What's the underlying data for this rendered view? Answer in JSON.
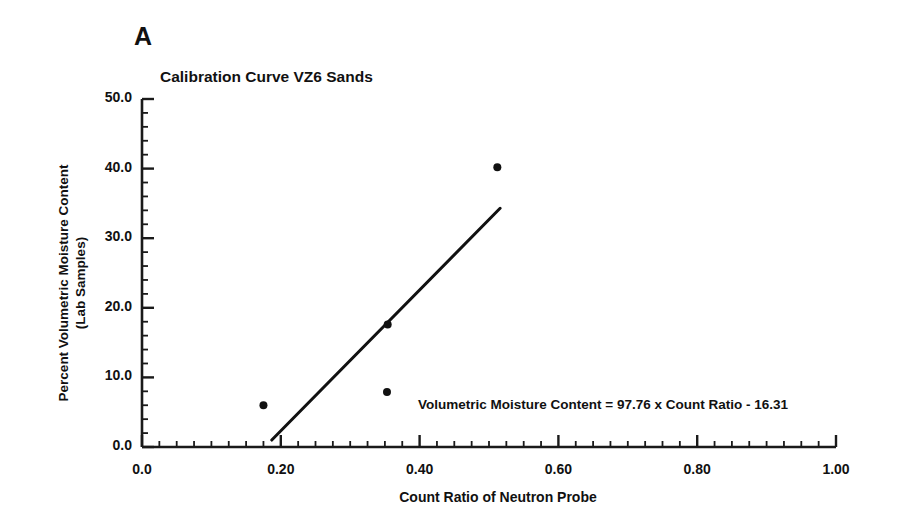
{
  "figure": {
    "panel_label": "A",
    "background_color": "#ffffff",
    "ink_color": "#1a1a1a"
  },
  "chart_data": {
    "type": "scatter",
    "title": "Calibration Curve VZ6 Sands",
    "xlabel": "Count Ratio of Neutron Probe",
    "ylabel": "Percent Volumetric Moisture Content\n(Lab Samples)",
    "ylabel_lines": [
      "Percent Volumetric Moisture Content",
      "(Lab Samples)"
    ],
    "xlim": [
      0.0,
      1.0
    ],
    "ylim": [
      0.0,
      50.0
    ],
    "xticks": [
      0.0,
      0.2,
      0.4,
      0.6,
      0.8,
      1.0
    ],
    "xtick_labels": [
      "0.0",
      "0.20",
      "0.40",
      "0.60",
      "0.80",
      "1.00"
    ],
    "yticks": [
      0.0,
      10.0,
      20.0,
      30.0,
      40.0,
      50.0
    ],
    "ytick_labels": [
      "0.0",
      "10.0",
      "20.0",
      "30.0",
      "40.0",
      "50.0"
    ],
    "x_minor_step": 0.025,
    "y_minor_step": 2.0,
    "grid": false,
    "legend": null,
    "series": [
      {
        "name": "Lab samples",
        "type": "scatter",
        "marker": "filled-circle",
        "marker_color": "#111111",
        "marker_size": 8,
        "points": [
          {
            "x": 0.175,
            "y": 6.0
          },
          {
            "x": 0.353,
            "y": 7.9
          },
          {
            "x": 0.354,
            "y": 17.6
          },
          {
            "x": 0.512,
            "y": 40.2
          }
        ]
      },
      {
        "name": "Regression line",
        "type": "line",
        "line_color": "#111111",
        "line_width": 3,
        "endpoints": [
          {
            "x": 0.187,
            "y": 1.0
          },
          {
            "x": 0.516,
            "y": 34.3
          }
        ]
      }
    ],
    "annotations": [
      {
        "name": "regression-equation",
        "text": "Volumetric Moisture Content = 97.76 x Count Ratio - 16.31",
        "slope": 97.76,
        "intercept": -16.31
      }
    ]
  }
}
